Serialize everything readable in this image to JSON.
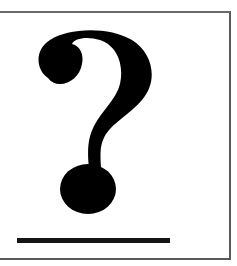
{
  "figure": {
    "symbol": "?",
    "symbol_icon": "question-mark-icon",
    "colors": {
      "background": "#ffffff",
      "symbol": "#000000",
      "border": "#5a5a5a",
      "underline": "#151515"
    }
  }
}
